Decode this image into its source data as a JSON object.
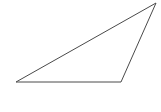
{
  "figure": {
    "canvas": {
      "width": 161,
      "height": 112,
      "background_color": "#ffffff"
    },
    "shape": {
      "name": "triangle",
      "type": "polygon",
      "classification": "scalene obtuse triangle",
      "fill": "none",
      "stroke_color": "#4a4a4a",
      "stroke_width": 1,
      "points_attr": "16,82 121,82 156,3",
      "vertices": [
        {
          "label": "bottom-left-vertex",
          "x": 16,
          "y": 82
        },
        {
          "label": "bottom-right-vertex",
          "x": 121,
          "y": 82
        },
        {
          "label": "top-right-apex",
          "x": 156,
          "y": 3
        }
      ],
      "edges": [
        {
          "name": "base-edge",
          "from": "bottom-left-vertex",
          "to": "bottom-right-vertex"
        },
        {
          "name": "right-edge",
          "from": "bottom-right-vertex",
          "to": "top-right-apex"
        },
        {
          "name": "hypotenuse-edge",
          "from": "top-right-apex",
          "to": "bottom-left-vertex"
        }
      ]
    }
  }
}
